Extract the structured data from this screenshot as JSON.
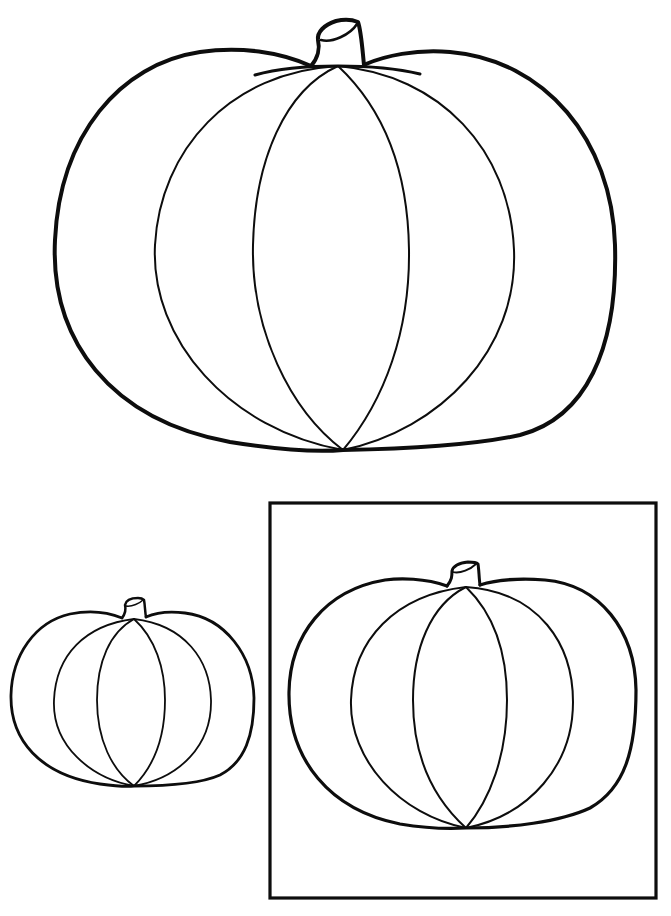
{
  "page": {
    "background": "#ffffff",
    "line_color": "#0d0d0d"
  },
  "figures": [
    {
      "id": "large-pumpkin",
      "description": "Large pumpkin outline",
      "framed": false
    },
    {
      "id": "small-pumpkin",
      "description": "Small pumpkin outline",
      "framed": false
    },
    {
      "id": "framed-pumpkin",
      "description": "Medium pumpkin outline inside square frame",
      "framed": true
    }
  ]
}
